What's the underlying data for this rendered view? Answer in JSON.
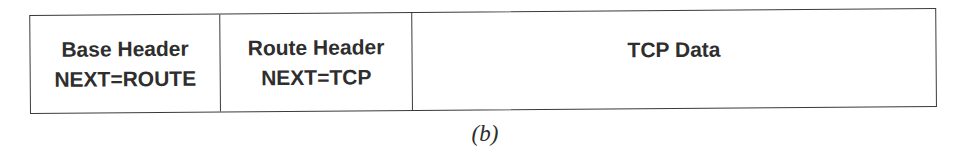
{
  "diagram": {
    "segments": [
      {
        "title": "Base Header",
        "subtitle": "NEXT=ROUTE"
      },
      {
        "title": "Route Header",
        "subtitle": "NEXT=TCP"
      },
      {
        "title": "TCP Data"
      }
    ],
    "caption": "(b)"
  }
}
